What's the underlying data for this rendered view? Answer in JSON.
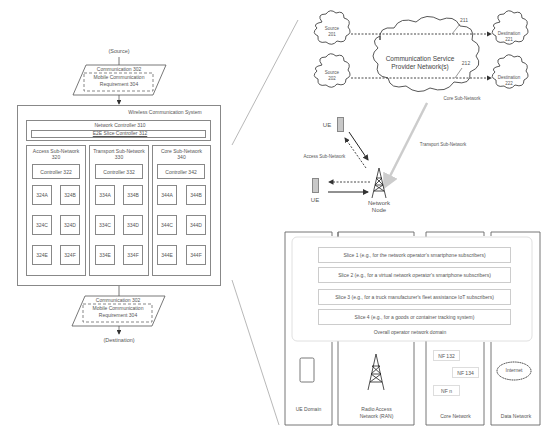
{
  "left_diagram": {
    "source_label": "(Source)",
    "destination_label": "(Destination)",
    "communication_top": {
      "label": "Communication 302",
      "requirement": "Mobile Communication Requirement 304",
      "requirement_line1": "Mobile Communication",
      "requirement_line2": "Requirement 304"
    },
    "communication_bottom": {
      "label": "Communication 302",
      "requirement_line1": "Mobile Communication",
      "requirement_line2": "Requirement 304"
    },
    "system": {
      "title": "Wireless Communication System",
      "network_controller": "Network Controller 310",
      "slice_controller": "E2E Slice Controller 312",
      "subnetworks": [
        {
          "name_line1": "Access Sub-Network",
          "name_line2": "320",
          "controller": "Controller 322",
          "units": [
            "324A",
            "324B",
            "324C",
            "324D",
            "324E",
            "324F"
          ]
        },
        {
          "name_line1": "Transport Sub-Network",
          "name_line2": "330",
          "controller": "Controller 332",
          "units": [
            "334A",
            "334B",
            "334C",
            "334D",
            "334E",
            "334F"
          ]
        },
        {
          "name_line1": "Core Sub-Network",
          "name_line2": "340",
          "controller": "Controller 342",
          "units": [
            "344A",
            "344B",
            "344C",
            "344D",
            "344E",
            "344F"
          ]
        }
      ]
    }
  },
  "top_right_diagram": {
    "sources": [
      {
        "line1": "Source",
        "line2": "201"
      },
      {
        "line1": "Source",
        "line2": "202"
      }
    ],
    "destinations": [
      {
        "line1": "Destination",
        "line2": "221"
      },
      {
        "line1": "Destination",
        "line2": "222"
      }
    ],
    "provider_cloud": {
      "line1": "Communication Service",
      "line2": "Provider Network(s)"
    },
    "path_labels": [
      "211",
      "212"
    ],
    "core_sub_network_label": "Core Sub-Network",
    "transport_sub_network_label": "Transport Sub-Network",
    "access_sub_network_label": "Access Sub-Network",
    "ue_labels": [
      "UE",
      "UE"
    ],
    "network_node": {
      "line1": "Network",
      "line2": "Node"
    }
  },
  "bottom_right_diagram": {
    "slices": [
      "Slice 1 (e.g., for the network operator's smartphone subscribers)",
      "Slice 2 (e.g., for a virtual network operator's smartphone subscribers)",
      "Slice 3 (e.g., for a truck manufacturer's fleet assistance IoT subscribers)",
      "Slice 4 (e.g., for a goods or container tracking system)"
    ],
    "operator_domain_label": "Overall operator network domain",
    "domains": [
      {
        "label": "UE Domain"
      },
      {
        "label_line1": "Radio Access",
        "label_line2": "Network (RAN)"
      },
      {
        "label": "Core Network"
      },
      {
        "label": "Data Network"
      }
    ],
    "network_functions": [
      "NF 132",
      "NF 134",
      "NF n"
    ],
    "internet_label": "Internet"
  },
  "colors": {
    "line": "#777777",
    "text": "#555555",
    "light_line": "#cccccc",
    "transport_arrow": "#d0d0d0",
    "ue_device": "#c8c8c8"
  }
}
